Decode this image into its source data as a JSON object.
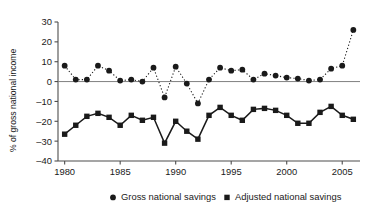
{
  "chart_data": {
    "type": "line",
    "title": "",
    "xlabel": "",
    "ylabel": "% of gross national income",
    "xlim": [
      1979.4,
      2006.6
    ],
    "ylim": [
      -40,
      30
    ],
    "yticks": [
      30,
      20,
      10,
      0,
      -10,
      -20,
      -30,
      -40
    ],
    "ytick_labels": [
      "30",
      "20",
      "10",
      "0",
      "–10",
      "–20",
      "–30",
      "–40"
    ],
    "xticks": [
      1980,
      1985,
      1990,
      1995,
      2000,
      2005
    ],
    "xtick_labels": [
      "1980",
      "1985",
      "1990",
      "1995",
      "2000",
      "2005"
    ],
    "grid": false,
    "zero_line": true,
    "legend_position": "bottom",
    "x": [
      1980,
      1981,
      1982,
      1983,
      1984,
      1985,
      1986,
      1987,
      1988,
      1989,
      1990,
      1991,
      1992,
      1993,
      1994,
      1995,
      1996,
      1997,
      1998,
      1999,
      2000,
      2001,
      2002,
      2003,
      2004,
      2005,
      2006
    ],
    "series": [
      {
        "name": "Gross national savings",
        "marker": "circle",
        "linestyle": "dotted",
        "color": "#1a1a1a",
        "values": [
          8,
          1,
          1,
          8,
          5.5,
          0.5,
          1,
          0,
          7,
          -8,
          7.5,
          -1,
          -11,
          1,
          7,
          5.5,
          6,
          1,
          4,
          3,
          2,
          1.5,
          0.5,
          1,
          6.5,
          8,
          26
        ]
      },
      {
        "name": "Adjusted national savings",
        "marker": "square",
        "linestyle": "solid",
        "color": "#1a1a1a",
        "values": [
          -26.5,
          -22,
          -17.5,
          -16,
          -18,
          -22,
          -17,
          -19.5,
          -18,
          -31,
          -20,
          -25,
          -29,
          -17,
          -13,
          -17,
          -19.5,
          -14,
          -13.5,
          -14.5,
          -17,
          -21,
          -21,
          -15.5,
          -12.5,
          -17,
          -19
        ]
      }
    ]
  },
  "legend": {
    "items": [
      {
        "label": "Gross national savings",
        "marker": "circle"
      },
      {
        "label": "Adjusted national savings",
        "marker": "square"
      }
    ]
  },
  "axis": {
    "y_axis_title": "% of gross national income"
  }
}
